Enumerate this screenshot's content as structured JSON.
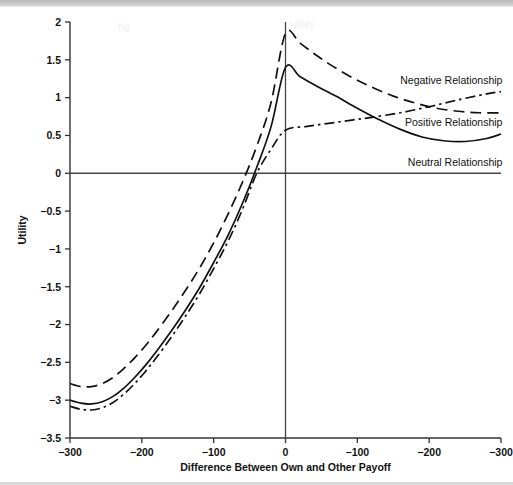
{
  "chart_data": {
    "type": "line",
    "title": "",
    "xlabel": "Difference Between Own and Other Payoff",
    "ylabel": "Utility",
    "grid": false,
    "legend_position": "inline-right",
    "xlim": [
      0,
      6
    ],
    "ylim": [
      -3.5,
      2
    ],
    "x_tick_labels": [
      "−300",
      "−200",
      "−100",
      "0",
      "−100",
      "−200",
      "−300"
    ],
    "x_tick_positions": [
      0,
      1,
      2,
      3,
      4,
      5,
      6
    ],
    "y_tick_labels": [
      "2",
      "1.5",
      "1",
      "0.5",
      "0",
      "−0.5",
      "−1",
      "−1.5",
      "−2",
      "−2.5",
      "−3",
      "−3.5"
    ],
    "y_tick_values": [
      2,
      1.5,
      1,
      0.5,
      0,
      -0.5,
      -1,
      -1.5,
      -2,
      -2.5,
      -3,
      -3.5
    ],
    "zero_line_y": 0,
    "center_line_x": 3,
    "series": [
      {
        "name": "Negative Relationship",
        "style": "dashed",
        "label_x": 6.02,
        "label_y": 1.18,
        "label_anchor": "end",
        "x": [
          0,
          0.15,
          0.3,
          0.45,
          0.6,
          0.75,
          0.9,
          1.05,
          1.2,
          1.4,
          1.6,
          1.8,
          2.0,
          2.2,
          2.4,
          2.6,
          2.8,
          3.0,
          3.2,
          3.4,
          3.6,
          3.9,
          4.2,
          4.5,
          4.8,
          5.1,
          5.4,
          5.7,
          6.0
        ],
        "y": [
          -2.78,
          -2.82,
          -2.82,
          -2.78,
          -2.7,
          -2.58,
          -2.44,
          -2.28,
          -2.1,
          -1.84,
          -1.56,
          -1.26,
          -0.92,
          -0.54,
          -0.12,
          0.36,
          0.94,
          1.85,
          1.72,
          1.58,
          1.45,
          1.28,
          1.14,
          1.02,
          0.93,
          0.86,
          0.82,
          0.8,
          0.8
        ]
      },
      {
        "name": "Positive Relationship",
        "style": "dash-dot",
        "label_x": 6.02,
        "label_y": 0.62,
        "label_anchor": "end",
        "x": [
          0,
          0.15,
          0.3,
          0.45,
          0.6,
          0.75,
          0.9,
          1.05,
          1.2,
          1.4,
          1.6,
          1.8,
          2.0,
          2.2,
          2.4,
          2.6,
          2.8,
          3.0,
          3.3,
          3.6,
          3.9,
          4.2,
          4.6,
          5.0,
          5.4,
          5.8,
          6.0
        ],
        "y": [
          -3.08,
          -3.12,
          -3.13,
          -3.1,
          -3.03,
          -2.92,
          -2.78,
          -2.62,
          -2.44,
          -2.18,
          -1.9,
          -1.6,
          -1.26,
          -0.9,
          -0.48,
          0.0,
          0.32,
          0.57,
          0.62,
          0.66,
          0.7,
          0.74,
          0.8,
          0.88,
          0.97,
          1.05,
          1.08
        ]
      },
      {
        "name": "Neutral Relationship",
        "style": "solid",
        "label_x": 6.02,
        "label_y": 0.1,
        "label_anchor": "end",
        "x": [
          0,
          0.15,
          0.3,
          0.45,
          0.6,
          0.75,
          0.9,
          1.05,
          1.2,
          1.4,
          1.6,
          1.8,
          2.0,
          2.2,
          2.4,
          2.6,
          2.8,
          3.0,
          3.2,
          3.4,
          3.7,
          4.0,
          4.3,
          4.6,
          4.9,
          5.2,
          5.5,
          5.8,
          6.0
        ],
        "y": [
          -3.0,
          -3.04,
          -3.05,
          -3.02,
          -2.95,
          -2.84,
          -2.7,
          -2.54,
          -2.36,
          -2.1,
          -1.82,
          -1.52,
          -1.18,
          -0.82,
          -0.4,
          0.08,
          0.62,
          1.4,
          1.28,
          1.17,
          1.02,
          0.86,
          0.71,
          0.58,
          0.48,
          0.43,
          0.42,
          0.46,
          0.52
        ]
      }
    ]
  }
}
